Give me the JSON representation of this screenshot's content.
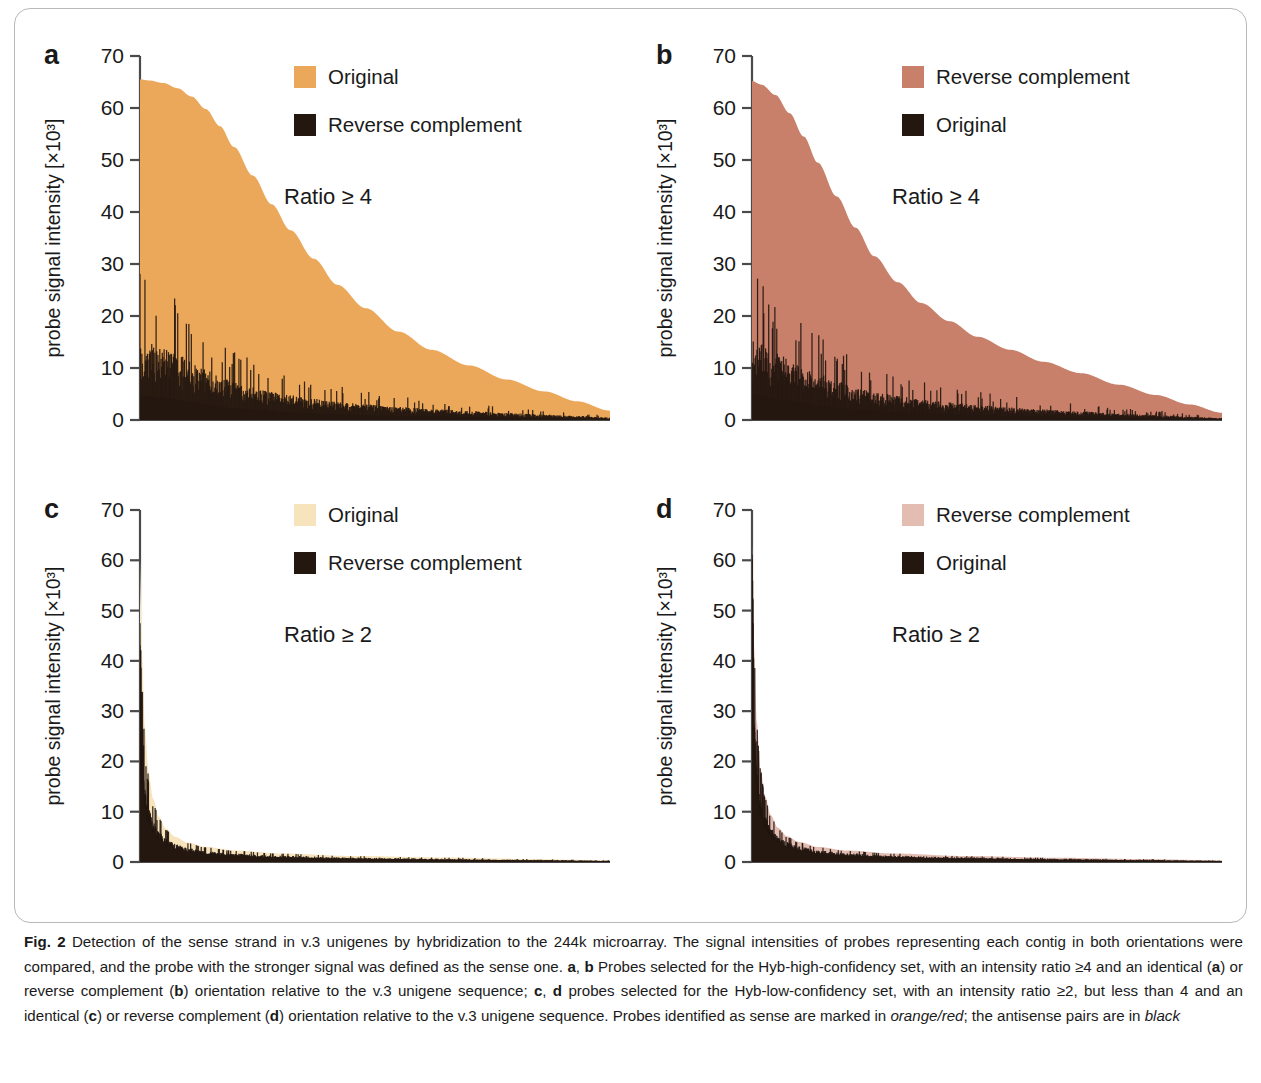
{
  "figure": {
    "label": "Fig. 2",
    "axis_y_label": "probe signal intensity [×10³]",
    "y_ticks": [
      0,
      10,
      20,
      30,
      40,
      50,
      60,
      70
    ],
    "caption_segments": [
      {
        "t": "Fig. 2",
        "style": "bold"
      },
      {
        "t": " Detection of the sense strand in v.3 unigenes by hybridization to the 244k microarray. The signal intensities of probes representing each contig in both orientations were compared, and the probe with the stronger signal was defined as the sense one. ",
        "style": "normal"
      },
      {
        "t": "a",
        "style": "bold"
      },
      {
        "t": ", ",
        "style": "normal"
      },
      {
        "t": "b",
        "style": "bold"
      },
      {
        "t": " Probes selected for the Hyb-high-confidency set, with an intensity ratio ≥4 and an identical (",
        "style": "normal"
      },
      {
        "t": "a",
        "style": "bold"
      },
      {
        "t": ") or reverse complement (",
        "style": "normal"
      },
      {
        "t": "b",
        "style": "bold"
      },
      {
        "t": ") orientation relative to the v.3 unigene sequence; ",
        "style": "normal"
      },
      {
        "t": "c",
        "style": "bold"
      },
      {
        "t": ", ",
        "style": "normal"
      },
      {
        "t": "d",
        "style": "bold"
      },
      {
        "t": " probes selected for the Hyb-low-confidency set, with an intensity ratio ≥2, but less than 4 and an identical (",
        "style": "normal"
      },
      {
        "t": "c",
        "style": "bold"
      },
      {
        "t": ") or reverse complement (",
        "style": "normal"
      },
      {
        "t": "d",
        "style": "bold"
      },
      {
        "t": ") orientation relative to the v.3 unigene sequence. Probes identified as sense are marked in ",
        "style": "normal"
      },
      {
        "t": "orange/red",
        "style": "italic"
      },
      {
        "t": "; the antisense pairs are in ",
        "style": "normal"
      },
      {
        "t": "black",
        "style": "italic"
      }
    ]
  },
  "colors": {
    "panel_a_sense": "#ECA85A",
    "panel_b_sense": "#C8806A",
    "panel_c_sense": "#F7E3BC",
    "panel_d_sense": "#E4BDB2",
    "antisense": "#231710",
    "axis": "#4a4a4a",
    "text": "#1a1a1a"
  },
  "chart_data": [
    {
      "id": "a",
      "type": "area",
      "letter": "a",
      "title": "",
      "ylabel": "probe signal intensity [×10³]",
      "xlabel": "",
      "ylim": [
        0,
        70
      ],
      "yticks": [
        0,
        10,
        20,
        30,
        40,
        50,
        60,
        70
      ],
      "grid": false,
      "annotation": "Ratio ≥ 4",
      "legend": {
        "position": "top-right",
        "entries": [
          {
            "label": "Original",
            "color": "#ECA85A"
          },
          {
            "label": "Reverse complement",
            "color": "#231710"
          }
        ]
      },
      "series": [
        {
          "name": "Original",
          "color": "#ECA85A",
          "x": [
            0,
            0.02,
            0.05,
            0.08,
            0.11,
            0.14,
            0.17,
            0.2,
            0.24,
            0.28,
            0.32,
            0.37,
            0.42,
            0.48,
            0.55,
            0.62,
            0.7,
            0.78,
            0.86,
            0.93,
            1.0
          ],
          "values": [
            65.5,
            65.3,
            64.8,
            63.8,
            62.2,
            59.8,
            56.5,
            52.5,
            47.0,
            41.5,
            36.5,
            31.0,
            26.0,
            21.5,
            17.0,
            13.5,
            10.5,
            7.8,
            5.5,
            3.6,
            1.8
          ]
        },
        {
          "name": "Reverse complement",
          "color": "#231710",
          "x": [
            0,
            0.02,
            0.05,
            0.08,
            0.11,
            0.14,
            0.17,
            0.2,
            0.24,
            0.28,
            0.32,
            0.37,
            0.42,
            0.48,
            0.55,
            0.62,
            0.7,
            0.78,
            0.86,
            0.93,
            1.0
          ],
          "values": [
            16.0,
            15.2,
            14.2,
            13.0,
            11.5,
            10.0,
            8.6,
            7.5,
            6.5,
            5.6,
            4.9,
            4.2,
            3.6,
            3.1,
            2.6,
            2.2,
            1.8,
            1.4,
            1.1,
            0.8,
            0.5
          ]
        }
      ]
    },
    {
      "id": "b",
      "type": "area",
      "letter": "b",
      "title": "",
      "ylabel": "probe signal intensity [×10³]",
      "xlabel": "",
      "ylim": [
        0,
        70
      ],
      "yticks": [
        0,
        10,
        20,
        30,
        40,
        50,
        60,
        70
      ],
      "grid": false,
      "annotation": "Ratio ≥ 4",
      "legend": {
        "position": "top-right",
        "entries": [
          {
            "label": "Reverse complement",
            "color": "#C8806A"
          },
          {
            "label": "Original",
            "color": "#231710"
          }
        ]
      },
      "series": [
        {
          "name": "Reverse complement",
          "color": "#C8806A",
          "x": [
            0,
            0.02,
            0.05,
            0.08,
            0.11,
            0.14,
            0.18,
            0.22,
            0.26,
            0.31,
            0.36,
            0.42,
            0.48,
            0.55,
            0.62,
            0.7,
            0.78,
            0.86,
            0.93,
            1.0
          ],
          "values": [
            65.2,
            64.5,
            62.5,
            59.0,
            54.5,
            49.5,
            43.0,
            37.0,
            31.5,
            26.5,
            22.5,
            19.0,
            16.0,
            13.5,
            11.2,
            9.0,
            6.8,
            4.8,
            3.0,
            1.4
          ]
        },
        {
          "name": "Original",
          "color": "#231710",
          "x": [
            0,
            0.02,
            0.05,
            0.08,
            0.11,
            0.14,
            0.18,
            0.22,
            0.26,
            0.31,
            0.36,
            0.42,
            0.48,
            0.55,
            0.62,
            0.7,
            0.78,
            0.86,
            0.93,
            1.0
          ],
          "values": [
            16.2,
            15.0,
            13.5,
            12.0,
            10.5,
            9.2,
            7.8,
            6.6,
            5.6,
            4.8,
            4.1,
            3.5,
            3.0,
            2.5,
            2.1,
            1.7,
            1.3,
            1.0,
            0.7,
            0.4
          ]
        }
      ]
    },
    {
      "id": "c",
      "type": "area",
      "letter": "c",
      "title": "",
      "ylabel": "probe signal intensity [×10³]",
      "xlabel": "",
      "ylim": [
        0,
        70
      ],
      "yticks": [
        0,
        10,
        20,
        30,
        40,
        50,
        60,
        70
      ],
      "grid": false,
      "annotation": "Ratio ≥ 2",
      "legend": {
        "position": "top-right",
        "entries": [
          {
            "label": "Original",
            "color": "#F7E3BC"
          },
          {
            "label": "Reverse complement",
            "color": "#231710"
          }
        ]
      },
      "series": [
        {
          "name": "Original",
          "color": "#F7E3BC",
          "x": [
            0,
            0.004,
            0.01,
            0.018,
            0.028,
            0.04,
            0.055,
            0.075,
            0.1,
            0.14,
            0.2,
            0.3,
            0.45,
            0.65,
            0.82,
            1.0
          ],
          "values": [
            60.0,
            42.0,
            27.0,
            18.0,
            12.5,
            9.0,
            6.6,
            5.0,
            3.9,
            3.0,
            2.3,
            1.7,
            1.2,
            0.9,
            0.6,
            0.35
          ]
        },
        {
          "name": "Reverse complement",
          "color": "#231710",
          "x": [
            0,
            0.004,
            0.01,
            0.018,
            0.028,
            0.04,
            0.055,
            0.075,
            0.1,
            0.14,
            0.2,
            0.3,
            0.45,
            0.65,
            0.82,
            1.0
          ],
          "values": [
            28.0,
            21.0,
            15.0,
            11.0,
            8.2,
            6.2,
            4.8,
            3.7,
            2.9,
            2.2,
            1.7,
            1.3,
            0.95,
            0.7,
            0.5,
            0.3
          ]
        }
      ]
    },
    {
      "id": "d",
      "type": "area",
      "letter": "d",
      "title": "",
      "ylabel": "probe signal intensity [×10³]",
      "xlabel": "",
      "ylim": [
        0,
        70
      ],
      "yticks": [
        0,
        10,
        20,
        30,
        40,
        50,
        60,
        70
      ],
      "grid": false,
      "annotation": "Ratio ≥ 2",
      "legend": {
        "position": "top-right",
        "entries": [
          {
            "label": "Reverse complement",
            "color": "#E4BDB2"
          },
          {
            "label": "Original",
            "color": "#231710"
          }
        ]
      },
      "series": [
        {
          "name": "Reverse complement",
          "color": "#E4BDB2",
          "x": [
            0,
            0.004,
            0.01,
            0.018,
            0.028,
            0.04,
            0.055,
            0.075,
            0.1,
            0.14,
            0.2,
            0.3,
            0.45,
            0.65,
            0.82,
            1.0
          ],
          "values": [
            63.0,
            44.0,
            28.0,
            18.5,
            13.0,
            9.3,
            6.8,
            5.1,
            4.0,
            3.0,
            2.3,
            1.7,
            1.2,
            0.85,
            0.6,
            0.33
          ]
        },
        {
          "name": "Original",
          "color": "#231710",
          "x": [
            0,
            0.004,
            0.01,
            0.018,
            0.028,
            0.04,
            0.055,
            0.075,
            0.1,
            0.14,
            0.2,
            0.3,
            0.45,
            0.65,
            0.82,
            1.0
          ],
          "values": [
            41.0,
            29.0,
            19.0,
            13.0,
            9.3,
            7.0,
            5.3,
            4.1,
            3.2,
            2.4,
            1.8,
            1.35,
            1.0,
            0.7,
            0.5,
            0.28
          ]
        }
      ]
    }
  ]
}
